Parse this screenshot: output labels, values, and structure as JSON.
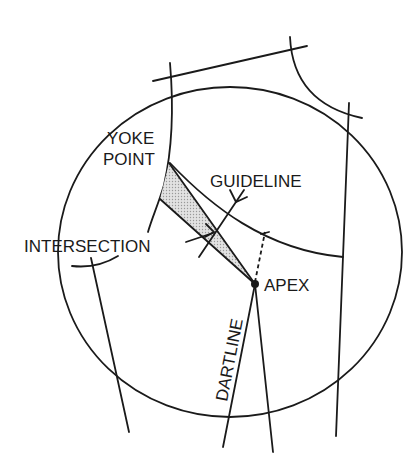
{
  "diagram": {
    "type": "pattern-drafting",
    "colors": {
      "line": "#1a1a1a",
      "shade": "#d4d4d4",
      "background": "#ffffff"
    },
    "labels": {
      "yoke_line1": "YOKE",
      "yoke_line2": "POINT",
      "guideline": "GUIDELINE",
      "intersection": "INTERSECTION",
      "apex": "APEX",
      "dartline": "DARTLINE"
    }
  }
}
